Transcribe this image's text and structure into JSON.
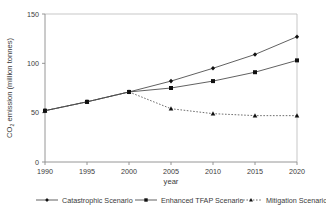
{
  "chart_data": {
    "type": "line",
    "title": "",
    "xlabel": "year",
    "ylabel": "CO2 emission (million tonnes)",
    "ylabel_main": "CO",
    "ylabel_sub": "2",
    "ylabel_rest": " emission (million tonnes)",
    "x": [
      1990,
      1995,
      2000,
      2005,
      2010,
      2015,
      2020
    ],
    "xticklabels": [
      "1990",
      "1995",
      "2000",
      "2005",
      "2010",
      "2015",
      "2020"
    ],
    "yticklabels": [
      "0",
      "50",
      "100",
      "150"
    ],
    "yticks": [
      0,
      50,
      100,
      150
    ],
    "xlim": [
      1990,
      2020
    ],
    "ylim": [
      0,
      150
    ],
    "grid": false,
    "legend_position": "bottom",
    "series": [
      {
        "name": "Catastrophic Scenario",
        "values": [
          52,
          61,
          71,
          82,
          95,
          109,
          127
        ],
        "marker": "diamond",
        "linestyle": "solid",
        "color": "#444444"
      },
      {
        "name": "Enhanced TFAP Scenario",
        "values": [
          52,
          61,
          71,
          75,
          82,
          91,
          103
        ],
        "marker": "square",
        "linestyle": "solid",
        "color": "#444444"
      },
      {
        "name": "Mitigation Scenario",
        "values": [
          52,
          61,
          71,
          54,
          49,
          47,
          47
        ],
        "marker": "triangle",
        "linestyle": "dotted",
        "color": "#555555"
      }
    ]
  },
  "legend": {
    "items": [
      {
        "label": "Catastrophic Scenario"
      },
      {
        "label": "Enhanced TFAP Scenario"
      },
      {
        "label": "Mitigation Scenario"
      }
    ]
  },
  "colors": {
    "axis": "#9a9a9a",
    "text": "#3a3a3a",
    "series_line": "#555555",
    "marker": "#101010",
    "background": "#ffffff"
  }
}
